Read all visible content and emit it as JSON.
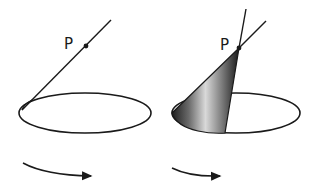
{
  "figures": [
    {
      "id": "line-rotation",
      "point_label": "P",
      "description": "Line through point P touching circle, before rotation"
    },
    {
      "id": "cone-surface",
      "point_label": "P",
      "description": "Line rotated around circle sweeping a cone with apex P"
    }
  ],
  "colors": {
    "stroke": "#1a1a1a",
    "cone_dark": "#2a2a2a",
    "cone_light": "#d8d8d8",
    "background": "#ffffff"
  },
  "arrows": [
    {
      "direction": "rotation-right"
    },
    {
      "direction": "rotation-right"
    }
  ]
}
